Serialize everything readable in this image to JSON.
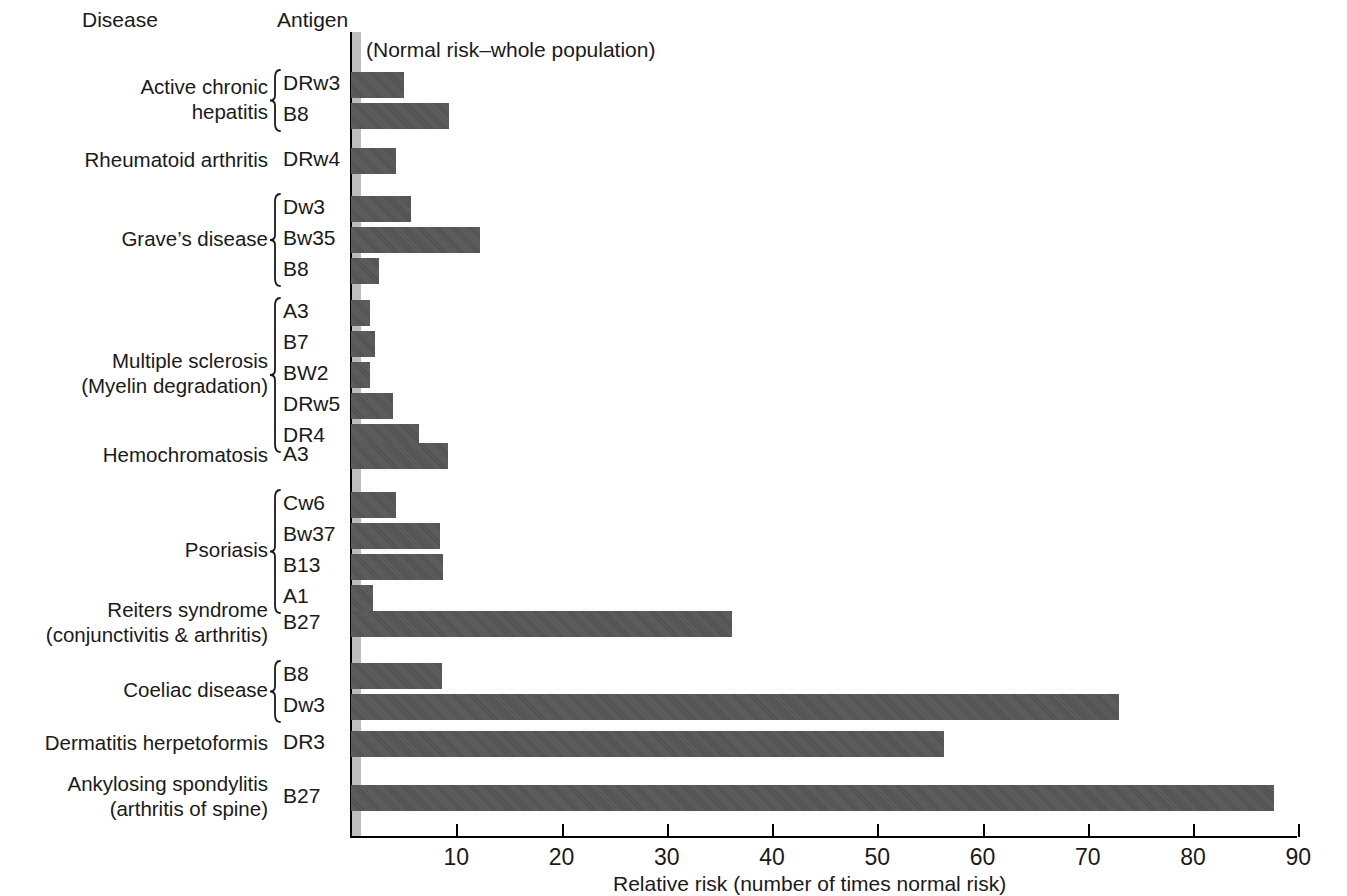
{
  "headers": {
    "disease": "Disease",
    "antigen": "Antigen"
  },
  "normal_risk_note": "(Normal risk–whole population)",
  "axis": {
    "title": "Relative risk (number of times normal risk)",
    "ticks": [
      10,
      20,
      30,
      40,
      50,
      60,
      70,
      80,
      90
    ],
    "tick_labels": [
      "10",
      "20",
      "30",
      "40",
      "50",
      "60",
      "70",
      "80",
      "90"
    ],
    "min": 0,
    "max": 95
  },
  "colors": {
    "bar": "#555555",
    "normal_band": "#bdbdbd",
    "axis": "#000000",
    "text": "#1a1a1a",
    "background": "#ffffff"
  },
  "groups": [
    {
      "disease": "Active chronic\nhepatitis",
      "braced": true,
      "rows": [
        {
          "antigen": "DRw3",
          "value": 5.0
        },
        {
          "antigen": "B8",
          "value": 9.3
        }
      ]
    },
    {
      "disease": "Rheumatoid arthritis",
      "braced": false,
      "rows": [
        {
          "antigen": "DRw4",
          "value": 4.3
        }
      ]
    },
    {
      "disease": "Grave’s disease",
      "braced": true,
      "rows": [
        {
          "antigen": "Dw3",
          "value": 5.7
        },
        {
          "antigen": "Bw35",
          "value": 12.3
        },
        {
          "antigen": "B8",
          "value": 2.7
        }
      ]
    },
    {
      "disease": "Multiple sclerosis\n(Myelin degradation)",
      "braced": true,
      "rows": [
        {
          "antigen": "A3",
          "value": 1.8
        },
        {
          "antigen": "B7",
          "value": 2.3
        },
        {
          "antigen": "BW2",
          "value": 1.8
        },
        {
          "antigen": "DRw5",
          "value": 4.0
        },
        {
          "antigen": "DR4",
          "value": 6.5
        }
      ]
    },
    {
      "disease": "Hemochromatosis",
      "braced": false,
      "rows": [
        {
          "antigen": "A3",
          "value": 9.2
        }
      ]
    },
    {
      "disease": "Psoriasis",
      "braced": true,
      "rows": [
        {
          "antigen": "Cw6",
          "value": 4.3
        },
        {
          "antigen": "Bw37",
          "value": 8.5
        },
        {
          "antigen": "B13",
          "value": 8.7
        },
        {
          "antigen": "A1",
          "value": 2.1
        }
      ]
    },
    {
      "disease": "Reiters syndrome\n(conjunctivitis & arthritis)",
      "braced": false,
      "rows": [
        {
          "antigen": "B27",
          "value": 36.2
        }
      ]
    },
    {
      "disease": "Coeliac disease",
      "braced": true,
      "rows": [
        {
          "antigen": "B8",
          "value": 8.6
        },
        {
          "antigen": "Dw3",
          "value": 73.0
        }
      ]
    },
    {
      "disease": "Dermatitis herpetoformis",
      "braced": false,
      "rows": [
        {
          "antigen": "DR3",
          "value": 56.3
        }
      ]
    },
    {
      "disease": "Ankylosing spondylitis\n(arthritis of spine)",
      "braced": false,
      "rows": [
        {
          "antigen": "B27",
          "value": 87.7
        }
      ]
    }
  ],
  "chart_data": {
    "type": "bar",
    "orientation": "horizontal",
    "title": "",
    "xlabel": "Relative risk (number of times normal risk)",
    "ylabel": "",
    "xlim": [
      0,
      95
    ],
    "grid": false,
    "legend": null,
    "annotations": [
      "(Normal risk–whole population)"
    ],
    "xticks": [
      10,
      20,
      30,
      40,
      50,
      60,
      70,
      80,
      90
    ],
    "categories": [
      "Active chronic hepatitis – DRw3",
      "Active chronic hepatitis – B8",
      "Rheumatoid arthritis – DRw4",
      "Grave’s disease – Dw3",
      "Grave’s disease – Bw35",
      "Grave’s disease – B8",
      "Multiple sclerosis – A3",
      "Multiple sclerosis – B7",
      "Multiple sclerosis – BW2",
      "Multiple sclerosis – DRw5",
      "Multiple sclerosis – DR4",
      "Hemochromatosis – A3",
      "Psoriasis – Cw6",
      "Psoriasis – Bw37",
      "Psoriasis – B13",
      "Psoriasis – A1",
      "Reiters syndrome – B27",
      "Coeliac disease – B8",
      "Coeliac disease – Dw3",
      "Dermatitis herpetoformis – DR3",
      "Ankylosing spondylitis – B27"
    ],
    "values": [
      5.0,
      9.3,
      4.3,
      5.7,
      12.3,
      2.7,
      1.8,
      2.3,
      1.8,
      4.0,
      6.5,
      9.2,
      4.3,
      8.5,
      8.7,
      2.1,
      36.2,
      8.6,
      73.0,
      56.3,
      87.7
    ]
  }
}
